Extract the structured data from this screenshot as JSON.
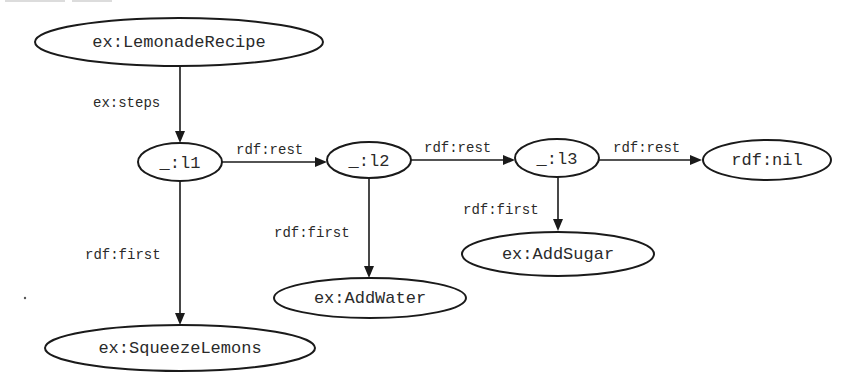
{
  "diagram": {
    "type": "rdf-graph",
    "title": "",
    "colors": {
      "stroke": "#1a1a1a",
      "text": "#2a2a2a",
      "background": "#ffffff"
    },
    "nodes": [
      {
        "id": "lemonade_recipe",
        "label": "ex:LemonadeRecipe",
        "cx": 179,
        "cy": 42,
        "rx": 144,
        "ry": 24
      },
      {
        "id": "l1",
        "label": "_:l1",
        "cx": 180,
        "cy": 162,
        "rx": 42,
        "ry": 19
      },
      {
        "id": "l2",
        "label": "_:l2",
        "cx": 369,
        "cy": 160,
        "rx": 42,
        "ry": 18
      },
      {
        "id": "l3",
        "label": "_:l3",
        "cx": 557,
        "cy": 158,
        "rx": 42,
        "ry": 19
      },
      {
        "id": "nil",
        "label": "rdf:nil",
        "cx": 767,
        "cy": 160,
        "rx": 64,
        "ry": 20
      },
      {
        "id": "add_sugar",
        "label": "ex:AddSugar",
        "cx": 558,
        "cy": 254,
        "rx": 96,
        "ry": 22
      },
      {
        "id": "add_water",
        "label": "ex:AddWater",
        "cx": 370,
        "cy": 298,
        "rx": 96,
        "ry": 20
      },
      {
        "id": "squeeze_lemons",
        "label": "ex:SqueezeLemons",
        "cx": 180,
        "cy": 348,
        "rx": 135,
        "ry": 23
      }
    ],
    "edges": [
      {
        "from": "lemonade_recipe",
        "to": "l1",
        "label": "ex:steps"
      },
      {
        "from": "l1",
        "to": "l2",
        "label": "rdf:rest"
      },
      {
        "from": "l2",
        "to": "l3",
        "label": "rdf:rest"
      },
      {
        "from": "l3",
        "to": "nil",
        "label": "rdf:rest"
      },
      {
        "from": "l1",
        "to": "squeeze_lemons",
        "label": "rdf:first"
      },
      {
        "from": "l2",
        "to": "add_water",
        "label": "rdf:first"
      },
      {
        "from": "l3",
        "to": "add_sugar",
        "label": "rdf:first"
      }
    ]
  }
}
